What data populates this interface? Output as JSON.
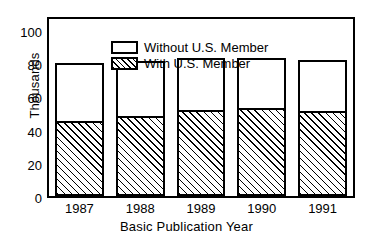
{
  "chart_data": {
    "type": "bar",
    "stacked": true,
    "title": "",
    "subtitle": "",
    "xlabel": "Basic Publication Year",
    "ylabel": "Thousands",
    "categories": [
      "1987",
      "1988",
      "1989",
      "1990",
      "1991"
    ],
    "series": [
      {
        "name": "With U.S. Member",
        "pattern": "hatched",
        "values": [
          48,
          51,
          55,
          56,
          54
        ]
      },
      {
        "name": "Without U.S. Member",
        "pattern": "solid-white",
        "values": [
          37,
          35,
          33,
          32,
          33
        ]
      }
    ],
    "totals": [
      85,
      86,
      88,
      88,
      87
    ],
    "ylim": [
      0,
      113
    ],
    "yticks": [
      "0",
      "20",
      "40",
      "60",
      "80",
      "100"
    ],
    "ytick_values": [
      0,
      20,
      40,
      60,
      80,
      100
    ],
    "grid": false,
    "legend_position": "top-left-inside",
    "legend_entries": [
      "Without U.S. Member",
      "With U.S. Member"
    ],
    "colors": {
      "axis": "#000000",
      "bar_outline": "#000000",
      "bar_fill_without": "#ffffff",
      "bar_fill_with": "#ffffff",
      "hatch": "#000000",
      "background": "#ffffff"
    }
  },
  "axes": {
    "y_title": "Thousands",
    "x_title": "Basic Publication Year",
    "y_ticks": [
      {
        "label": "100",
        "value": 100
      },
      {
        "label": "80",
        "value": 80
      },
      {
        "label": "60",
        "value": 60
      },
      {
        "label": "40",
        "value": 40
      },
      {
        "label": "20",
        "value": 20
      },
      {
        "label": "0",
        "value": 0
      }
    ],
    "x_ticks": [
      {
        "label": "1987"
      },
      {
        "label": "1988"
      },
      {
        "label": "1989"
      },
      {
        "label": "1990"
      },
      {
        "label": "1991"
      }
    ]
  },
  "legend": {
    "items": [
      {
        "label": "Without U.S. Member",
        "pattern": "solid-white"
      },
      {
        "label": "With U.S. Member",
        "pattern": "hatched"
      }
    ]
  }
}
